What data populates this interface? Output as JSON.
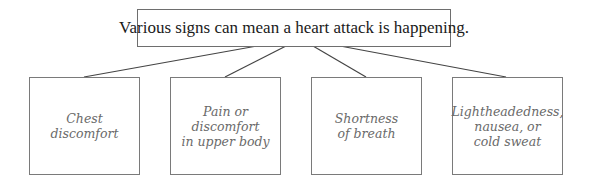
{
  "diagram": {
    "root": {
      "label": "Various signs can mean a heart attack is happening."
    },
    "children": [
      {
        "lines": [
          "Chest",
          "discomfort"
        ]
      },
      {
        "lines": [
          "Pain or discomfort",
          "in upper body"
        ]
      },
      {
        "lines": [
          "Shortness",
          "of breath"
        ]
      },
      {
        "lines": [
          "Lightheadedness,",
          "nausea, or",
          "cold sweat"
        ]
      }
    ],
    "colors": {
      "border": "#6e6e6e",
      "root_text": "#1a1a1a",
      "child_text": "#6a6a6a",
      "connector": "#444444"
    }
  }
}
